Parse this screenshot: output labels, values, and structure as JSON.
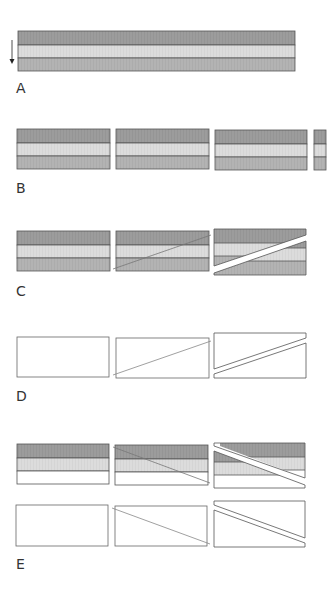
{
  "panels": [
    {
      "label": "A",
      "description": "Intact layered strata with downward arrow"
    },
    {
      "label": "B",
      "description": "Strata cut into blocks"
    },
    {
      "label": "C",
      "description": "Layered block, cut line, offset along fault"
    },
    {
      "label": "D",
      "description": "Empty block, cut line, offset along fault"
    },
    {
      "label": "E",
      "description": "Layered and empty blocks with opposite fault offset"
    }
  ],
  "colors": {
    "layer_dark": "#9c9c9c",
    "layer_light": "#dcdcdc",
    "layer_mid": "#b3b3b3",
    "border": "#555555",
    "cut_line": "#777777"
  }
}
